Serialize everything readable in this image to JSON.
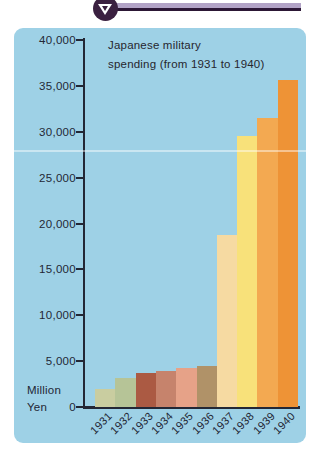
{
  "header": {
    "marker_icon": "down-triangle-in-circle",
    "circle_color": "#3a2040",
    "band_light_color": "#b2a3c6",
    "band_dark_color": "#2c1735"
  },
  "panel": {
    "background": "#9ed1e6"
  },
  "chart_data": {
    "type": "bar",
    "title_line1": "Japanese military",
    "title_line2": "spending (from 1931 to 1940)",
    "unit_label_line1": "Million",
    "unit_label_line2": "Yen",
    "categories": [
      "1931",
      "1932",
      "1933",
      "1934",
      "1935",
      "1936",
      "1937",
      "1938",
      "1939",
      "1940"
    ],
    "values": [
      2000,
      3200,
      3700,
      3900,
      4250,
      4500,
      18800,
      29500,
      31500,
      35600
    ],
    "bar_colors": [
      "#c9cda0",
      "#b6c497",
      "#ab5a43",
      "#c6836c",
      "#e6a288",
      "#b09268",
      "#f6daa2",
      "#f8e17a",
      "#f3a951",
      "#ee9336"
    ],
    "y_tick_labels": [
      "40,000",
      "35,000",
      "30,000",
      "25,000",
      "20,000",
      "15,000",
      "10,000",
      "5,000",
      "0"
    ],
    "ylim": [
      0,
      40000
    ],
    "ylabel": "Million Yen",
    "legend": "none",
    "grid": "off",
    "axis_color": "#232735",
    "text_color": "#26262e"
  }
}
